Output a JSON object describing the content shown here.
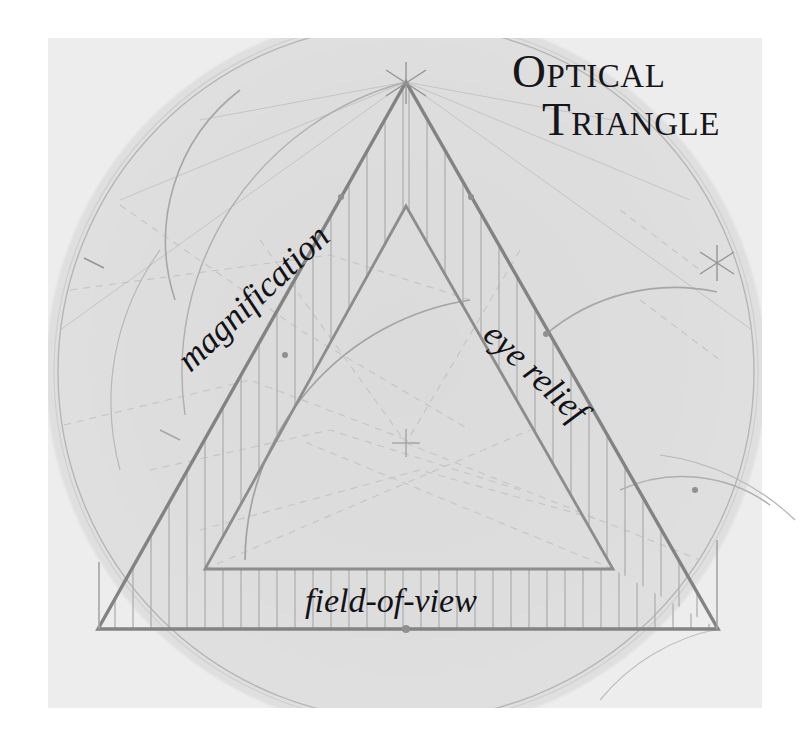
{
  "figure": {
    "title_lines": [
      "Optical",
      "Triangle"
    ],
    "labels": {
      "left_edge": "magnification",
      "right_edge": "eye relief",
      "base_edge": "field-of-view"
    },
    "colors": {
      "paper": "#ffffff",
      "shaded_field": "#dcdcdc",
      "construction_line": "#9a9a9a",
      "primary_line": "#7c7c7c",
      "hatch_line": "#a8a8a8",
      "ink": "#15151a"
    },
    "geometry": {
      "outer_triangle": {
        "apex": [
          406,
          82
        ],
        "bottom_left": [
          98,
          629
        ],
        "bottom_right": [
          718,
          629
        ]
      },
      "inner_triangle": {
        "apex": [
          406,
          206
        ],
        "bottom_left": [
          205,
          569
        ],
        "bottom_right": [
          613,
          569
        ]
      },
      "center_axis_x": 406,
      "baseline_y": 629,
      "shaded_field_rect": [
        48,
        38,
        762,
        708
      ],
      "circle": {
        "center": [
          406,
          372
        ],
        "radius": 348
      }
    }
  }
}
